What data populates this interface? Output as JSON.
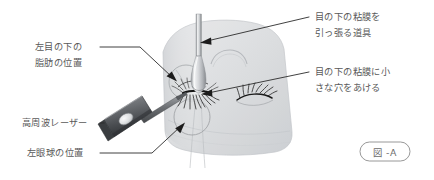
{
  "figure": {
    "caption_label": "図 -A",
    "background_color": "#ffffff",
    "text_color": "#595959",
    "leader_color": "#2b2b2b"
  },
  "annotations": [
    {
      "id": "retractor-tool",
      "name": "annotation-retractor-tool",
      "line1": "目の下の粘膜を",
      "line2": "引っ張る道具",
      "side": "right",
      "points_to": "retractor-shaft"
    },
    {
      "id": "mucosa-incision",
      "name": "annotation-mucosa-incision",
      "line1": "目の下の粘膜に小",
      "line2": "さな穴をあける",
      "side": "right",
      "points_to": "incision-site"
    },
    {
      "id": "fat-position",
      "name": "annotation-fat-position",
      "line1": "左目の下の",
      "line2": "脂肪の位置",
      "side": "left",
      "points_to": "fat-circle"
    },
    {
      "id": "rf-laser",
      "name": "annotation-rf-laser",
      "line1": "高周波レーザー",
      "line2": "",
      "side": "left",
      "points_to": "laser-handpiece"
    },
    {
      "id": "eyeball-position",
      "name": "annotation-eyeball-position",
      "line1": "左眼球の位置",
      "line2": "",
      "side": "left",
      "points_to": "eyeball-circle"
    }
  ],
  "illustration": {
    "face_label": "面部シルエット",
    "parts": [
      {
        "id": "face-silhouette",
        "name": "face-silhouette"
      },
      {
        "id": "brow-arc",
        "name": "brow-arc"
      },
      {
        "id": "retractor-shaft",
        "name": "retractor-instrument"
      },
      {
        "id": "laser-handpiece",
        "name": "rf-laser-handpiece"
      },
      {
        "id": "fat-circle",
        "name": "fat-position-circle"
      },
      {
        "id": "eyeball-circle",
        "name": "eyeball-position-circle"
      },
      {
        "id": "incision-site",
        "name": "incision-site"
      },
      {
        "id": "left-eyelashes",
        "name": "left-eyelashes"
      },
      {
        "id": "right-eyelashes",
        "name": "right-eyelashes"
      }
    ]
  }
}
